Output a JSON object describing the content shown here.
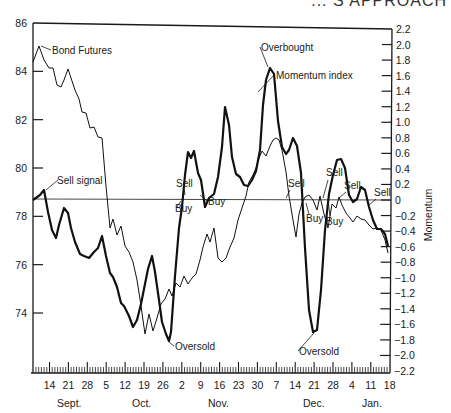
{
  "header_fragment": "... S APPROACH",
  "chart_data": {
    "type": "line",
    "title": "",
    "xlabel": "",
    "ylabel_left": "Bond Futures price",
    "ylabel_right": "Momentum",
    "left_axis": {
      "ticks": [
        74,
        76,
        78,
        80,
        82,
        84,
        86
      ],
      "range": [
        72,
        86
      ]
    },
    "right_axis": {
      "ticks": [
        2.2,
        2.0,
        1.8,
        1.6,
        1.4,
        1.2,
        1.0,
        0.8,
        0.6,
        0.4,
        0.2,
        0,
        -0.2,
        -0.4,
        -0.6,
        -0.8,
        -1.0,
        -1.2,
        -1.4,
        -1.6,
        -1.8,
        -2.0,
        -2.2
      ],
      "tick_labels": [
        "2.2",
        "2.0",
        "1.8",
        "1.6",
        "1.4",
        "1.2",
        "1.0",
        "0.8",
        "0.6",
        "0.4",
        "0.2",
        "0",
        "−0.2",
        "−0.4",
        "−0.6",
        "−0.8",
        "−1.0",
        "−1.2",
        "−1.4",
        "−1.6",
        "−1.8",
        "−2.0",
        "−2.2"
      ],
      "range": [
        -2.2,
        2.2
      ]
    },
    "x_tick_labels": [
      "14",
      "21",
      "28",
      "5",
      "12",
      "19",
      "26",
      "2",
      "9",
      "16",
      "23",
      "30",
      "7",
      "14",
      "21",
      "28",
      "4",
      "11",
      "18"
    ],
    "months": [
      {
        "label": "Sept.",
        "x": 57
      },
      {
        "label": "Oct.",
        "x": 132
      },
      {
        "label": "Nov.",
        "x": 208
      },
      {
        "label": "Dec.",
        "x": 303
      },
      {
        "label": "Jan.",
        "x": 362
      }
    ],
    "series": [
      {
        "name": "Bond Futures",
        "axis": "left",
        "style": "thin",
        "points_xy": [
          [
            33,
            62
          ],
          [
            39,
            46
          ],
          [
            44,
            60
          ],
          [
            49,
            68
          ],
          [
            53,
            68
          ],
          [
            57,
            85
          ],
          [
            61,
            87
          ],
          [
            64,
            80
          ],
          [
            68,
            69
          ],
          [
            71,
            78
          ],
          [
            75,
            90
          ],
          [
            79,
            99
          ],
          [
            82,
            112
          ],
          [
            86,
            113
          ],
          [
            90,
            128
          ],
          [
            94,
            127
          ],
          [
            98,
            137
          ],
          [
            102,
            138
          ],
          [
            106,
            186
          ],
          [
            110,
            228
          ],
          [
            113,
            219
          ],
          [
            117,
            235
          ],
          [
            121,
            226
          ],
          [
            125,
            246
          ],
          [
            129,
            252
          ],
          [
            133,
            262
          ],
          [
            137,
            280
          ],
          [
            140,
            299
          ],
          [
            145,
            334
          ],
          [
            149,
            314
          ],
          [
            153,
            331
          ],
          [
            157,
            318
          ],
          [
            161,
            304
          ],
          [
            165,
            299
          ],
          [
            169,
            289
          ],
          [
            172,
            296
          ],
          [
            176,
            283
          ],
          [
            180,
            287
          ],
          [
            184,
            276
          ],
          [
            188,
            284
          ],
          [
            192,
            278
          ],
          [
            196,
            274
          ],
          [
            200,
            260
          ],
          [
            203,
            247
          ],
          [
            207,
            234
          ],
          [
            210,
            242
          ],
          [
            214,
            228
          ],
          [
            218,
            258
          ],
          [
            222,
            262
          ],
          [
            226,
            258
          ],
          [
            230,
            247
          ],
          [
            234,
            238
          ],
          [
            238,
            220
          ],
          [
            242,
            208
          ],
          [
            246,
            196
          ],
          [
            249,
            182
          ],
          [
            253,
            175
          ],
          [
            256,
            168
          ],
          [
            259,
            158
          ],
          [
            262,
            151
          ],
          [
            266,
            156
          ],
          [
            270,
            146
          ],
          [
            273,
            140
          ],
          [
            276,
            138
          ],
          [
            279,
            140
          ],
          [
            282,
            150
          ],
          [
            286,
            172
          ],
          [
            289,
            196
          ],
          [
            293,
            220
          ],
          [
            296,
            237
          ],
          [
            299,
            214
          ],
          [
            302,
            203
          ],
          [
            305,
            197
          ],
          [
            309,
            195
          ],
          [
            313,
            200
          ],
          [
            317,
            210
          ],
          [
            320,
            196
          ],
          [
            324,
            214
          ],
          [
            328,
            228
          ],
          [
            332,
            204
          ],
          [
            336,
            208
          ],
          [
            339,
            197
          ],
          [
            342,
            205
          ],
          [
            346,
            213
          ],
          [
            350,
            218
          ],
          [
            353,
            222
          ],
          [
            357,
            216
          ],
          [
            361,
            219
          ],
          [
            365,
            220
          ],
          [
            369,
            225
          ],
          [
            373,
            229
          ],
          [
            377,
            228
          ],
          [
            381,
            230
          ],
          [
            385,
            240
          ],
          [
            388,
            253
          ]
        ]
      },
      {
        "name": "Momentum index",
        "axis": "right",
        "style": "thick",
        "points_xy": [
          [
            33,
            200
          ],
          [
            40,
            195
          ],
          [
            44,
            190
          ],
          [
            48,
            212
          ],
          [
            52,
            230
          ],
          [
            56,
            238
          ],
          [
            59,
            225
          ],
          [
            64,
            208
          ],
          [
            68,
            213
          ],
          [
            71,
            228
          ],
          [
            75,
            242
          ],
          [
            80,
            254
          ],
          [
            84,
            256
          ],
          [
            89,
            258
          ],
          [
            94,
            252
          ],
          [
            98,
            248
          ],
          [
            102,
            236
          ],
          [
            106,
            256
          ],
          [
            110,
            273
          ],
          [
            113,
            277
          ],
          [
            117,
            287
          ],
          [
            121,
            303
          ],
          [
            124,
            306
          ],
          [
            129,
            316
          ],
          [
            133,
            327
          ],
          [
            137,
            320
          ],
          [
            141,
            304
          ],
          [
            144,
            289
          ],
          [
            148,
            269
          ],
          [
            152,
            256
          ],
          [
            155,
            272
          ],
          [
            159,
            300
          ],
          [
            162,
            322
          ],
          [
            166,
            334
          ],
          [
            169,
            341
          ],
          [
            171,
            332
          ],
          [
            175,
            276
          ],
          [
            179,
            228
          ],
          [
            182,
            207
          ],
          [
            185,
            175
          ],
          [
            188,
            152
          ],
          [
            191,
            158
          ],
          [
            194,
            151
          ],
          [
            198,
            173
          ],
          [
            201,
            180
          ],
          [
            205,
            207
          ],
          [
            209,
            198
          ],
          [
            214,
            194
          ],
          [
            218,
            177
          ],
          [
            222,
            147
          ],
          [
            225,
            107
          ],
          [
            229,
            125
          ],
          [
            232,
            157
          ],
          [
            236,
            174
          ],
          [
            240,
            177
          ],
          [
            244,
            185
          ],
          [
            248,
            186
          ],
          [
            252,
            180
          ],
          [
            256,
            171
          ],
          [
            260,
            150
          ],
          [
            263,
            105
          ],
          [
            266,
            80
          ],
          [
            270,
            68
          ],
          [
            274,
            74
          ],
          [
            278,
            121
          ],
          [
            282,
            147
          ],
          [
            286,
            154
          ],
          [
            289,
            150
          ],
          [
            293,
            138
          ],
          [
            297,
            146
          ],
          [
            301,
            173
          ],
          [
            305,
            248
          ],
          [
            309,
            310
          ],
          [
            313,
            332
          ],
          [
            317,
            330
          ],
          [
            321,
            290
          ],
          [
            325,
            230
          ],
          [
            329,
            194
          ],
          [
            333,
            175
          ],
          [
            337,
            160
          ],
          [
            341,
            159
          ],
          [
            345,
            168
          ],
          [
            349,
            195
          ],
          [
            353,
            202
          ],
          [
            357,
            199
          ],
          [
            361,
            187
          ],
          [
            365,
            190
          ],
          [
            369,
            207
          ],
          [
            373,
            220
          ],
          [
            377,
            229
          ],
          [
            381,
            229
          ],
          [
            385,
            234
          ],
          [
            388,
            246
          ]
        ]
      }
    ],
    "annotations": [
      {
        "text": "Bond Futures",
        "x": 52,
        "y": 54
      },
      {
        "text": "Sell signal",
        "x": 57,
        "y": 184
      },
      {
        "text": "Oversold",
        "x": 175,
        "y": 350
      },
      {
        "text": "Sell",
        "x": 176,
        "y": 187
      },
      {
        "text": "Buy",
        "x": 175,
        "y": 212
      },
      {
        "text": "Buy",
        "x": 208,
        "y": 205
      },
      {
        "text": "Overbought",
        "x": 261,
        "y": 51
      },
      {
        "text": "Momentum index",
        "x": 276,
        "y": 79
      },
      {
        "text": "Sell",
        "x": 288,
        "y": 187
      },
      {
        "text": "Oversold",
        "x": 299,
        "y": 355
      },
      {
        "text": "Buy",
        "x": 306,
        "y": 222
      },
      {
        "text": "Sell",
        "x": 326,
        "y": 176
      },
      {
        "text": "Buy",
        "x": 326,
        "y": 225
      },
      {
        "text": "Sell",
        "x": 344,
        "y": 189
      },
      {
        "text": "Sell",
        "x": 374,
        "y": 196
      }
    ],
    "zero_line": 0,
    "grid": false
  }
}
